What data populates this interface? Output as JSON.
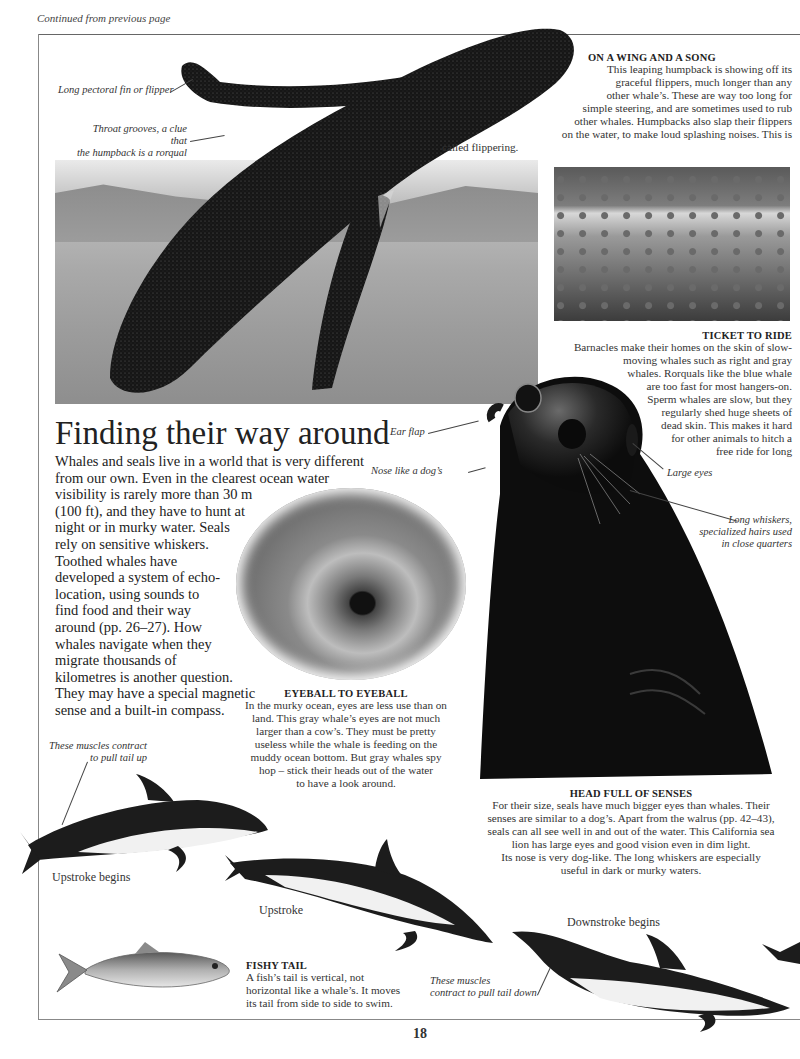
{
  "header": {
    "continued": "Continued from previous page"
  },
  "page_number": "18",
  "humpback": {
    "labels": {
      "flipper": "Long pectoral fin or flipper",
      "throat_line1": "Throat grooves, a clue that",
      "throat_line2": "the humpback is a rorqual"
    },
    "caption": {
      "title": "ON A WING AND A SONG",
      "lines": [
        "This leaping humpback is showing off its",
        "graceful flippers, much longer than any",
        "other whale’s. These are way too long for",
        "simple steering, and are sometimes used to rub",
        "other whales. Humpbacks also slap their flippers",
        "on the water, to make loud splashing noises. This is",
        "called flippering."
      ]
    }
  },
  "barnacles": {
    "caption": {
      "title": "TICKET TO RIDE",
      "lines": [
        "Barnacles make their homes on the skin of slow-",
        "moving whales such as right and gray",
        "whales. Rorquals like the blue whale",
        "are too fast for most hangers-on.",
        "Sperm whales are slow, but they",
        "regularly shed huge sheets of",
        "dead skin. This makes it hard",
        "for other animals to hitch a",
        "free ride for long"
      ]
    }
  },
  "main": {
    "heading": "Finding their way around",
    "lines": [
      "Whales and seals live in a world that is very different",
      "from our own. Even in the clearest ocean water",
      "visibility is rarely more than 30 m",
      "(100 ft), and they have to hunt at",
      "night or in murky water. Seals",
      "rely on sensitive whiskers.",
      "Toothed whales have",
      "developed a system of echo-",
      "location, using sounds to",
      "find food and their way",
      "around (pp. 26–27). How",
      "whales navigate when they",
      "migrate thousands of",
      "kilometres is another question.",
      "They may have a special magnetic",
      "sense and a built-in compass."
    ]
  },
  "eyeball": {
    "caption": {
      "title": "EYEBALL TO EYEBALL",
      "lines": [
        "In the murky ocean, eyes are less use than on",
        "land. This gray whale’s eyes are not much",
        "larger than a cow’s. They must be pretty",
        "useless while the whale is feeding on the",
        "muddy ocean bottom. But gray whales spy",
        "hop – stick their heads out of the water",
        "to have a look around."
      ]
    }
  },
  "sealion": {
    "labels": {
      "ear": "Ear flap",
      "nose": "Nose like a dog’s",
      "eyes": "Large eyes",
      "whiskers_line1": "Long whiskers,",
      "whiskers_line2": "specialized hairs used",
      "whiskers_line3": "in close quarters"
    },
    "caption": {
      "title": "HEAD FULL OF SENSES",
      "lines": [
        "For their size, seals have much bigger eyes than whales. Their",
        "senses are similar to a dog’s. Apart from the walrus (pp. 42–43),",
        "seals can all see well in and out of the water. This California sea",
        "lion has large eyes and good vision even in dim light.",
        "Its nose is very dog-like. The long whiskers are especially",
        "useful in dark or murky waters."
      ]
    }
  },
  "dolphins": {
    "muscles_up_line1": "These muscles contract",
    "muscles_up_line2": "to pull tail up",
    "upstroke_begins": "Upstroke begins",
    "upstroke": "Upstroke",
    "downstroke_begins": "Downstroke begins",
    "muscles_down_line1": "These muscles",
    "muscles_down_line2": "contract to pull tail down"
  },
  "fish": {
    "caption": {
      "title": "FISHY TAIL",
      "lines": [
        "A fish’s tail is vertical, not",
        "horizontal like a whale’s. It moves",
        "its tail from side to side to swim."
      ]
    }
  }
}
